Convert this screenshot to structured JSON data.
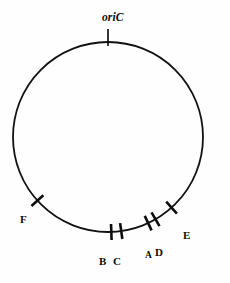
{
  "figure": {
    "kind": "circular-genome-map",
    "background_color": "#fefefe",
    "line_color": "#111111",
    "label_color": "#0b0b0b"
  },
  "origin": {
    "label": "oriC",
    "style": "bold-italic",
    "label_x": 118,
    "label_y": 12,
    "tick_angle_deg": 270,
    "tick_inner": 0.86,
    "tick_outer": 1.0
  },
  "circle": {
    "center_x": 108,
    "center_y": 137,
    "radius": 95,
    "stroke_width": 1.8
  },
  "chart_data": {
    "type": "scatter",
    "title": "",
    "xlabel": "",
    "ylabel": "",
    "layout": "circular genome with perpendicular tick markers at mapped loci",
    "markers": [
      {
        "label": "F",
        "angle_deg": 138,
        "label_x": 20,
        "label_y": 214,
        "size": "normal"
      },
      {
        "label": "B",
        "angle_deg": 88,
        "label_x": 99,
        "label_y": 256,
        "size": "normal"
      },
      {
        "label": "C",
        "angle_deg": 82,
        "label_x": 113,
        "label_y": 256,
        "size": "normal"
      },
      {
        "label": "A",
        "angle_deg": 65,
        "label_x": 145,
        "label_y": 251,
        "size": "small"
      },
      {
        "label": "D",
        "angle_deg": 60,
        "label_x": 155,
        "label_y": 247,
        "size": "normal"
      },
      {
        "label": "E",
        "angle_deg": 48,
        "label_x": 183,
        "label_y": 230,
        "size": "normal"
      }
    ],
    "marker_labels": [
      "F",
      "B",
      "C",
      "A",
      "D",
      "E"
    ],
    "marker_angles_deg": [
      138,
      88,
      82,
      65,
      60,
      48
    ],
    "tick_half_length": 8,
    "legend": "none",
    "grid": false
  }
}
